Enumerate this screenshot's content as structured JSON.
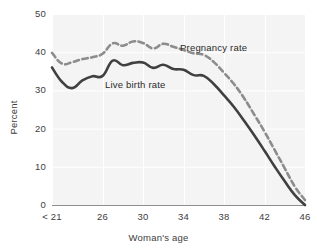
{
  "chart_data": {
    "type": "line",
    "title": "",
    "subtitle": "",
    "xlabel": "Woman's age",
    "ylabel": "Percent",
    "xlim": [
      21,
      46
    ],
    "ylim": [
      0,
      50
    ],
    "grid": true,
    "legend_position": "inline-annotation",
    "x_tick_labels": [
      "< 21",
      "26",
      "30",
      "34",
      "38",
      "42",
      "46"
    ],
    "x_tick_values": [
      21,
      26,
      30,
      34,
      38,
      42,
      46
    ],
    "y_tick_labels": [
      "0",
      "10",
      "20",
      "30",
      "40",
      "50"
    ],
    "y_tick_values": [
      0,
      10,
      20,
      30,
      40,
      50
    ],
    "x": [
      21,
      22,
      23,
      24,
      25,
      26,
      27,
      28,
      29,
      30,
      31,
      32,
      33,
      34,
      35,
      36,
      37,
      38,
      39,
      40,
      41,
      42,
      43,
      44,
      45,
      46
    ],
    "series": [
      {
        "name": "Pregnancy rate",
        "style": "dashed",
        "color": "#8c8c8c",
        "values": [
          39.8,
          37.0,
          37.4,
          38.2,
          38.7,
          39.6,
          42.3,
          41.7,
          42.8,
          42.4,
          41.0,
          42.2,
          41.4,
          40.6,
          39.7,
          39.3,
          37.4,
          34.6,
          31.6,
          27.9,
          23.6,
          19.2,
          14.4,
          9.6,
          4.8,
          1.3
        ],
        "annotation": {
          "text": "Pregnancy rate",
          "x_px": 180,
          "y_px": 42
        }
      },
      {
        "name": "Live birth rate",
        "style": "solid",
        "color": "#404040",
        "values": [
          36.0,
          32.2,
          30.6,
          32.6,
          33.7,
          33.8,
          37.8,
          36.6,
          37.2,
          37.3,
          35.9,
          36.7,
          35.6,
          35.4,
          34.0,
          33.8,
          31.6,
          28.7,
          25.6,
          22.0,
          18.2,
          14.2,
          10.1,
          6.2,
          2.6,
          0.0
        ],
        "annotation": {
          "text": "Live birth rate",
          "x_px": 105,
          "y_px": 79
        }
      }
    ],
    "colors": {
      "plot_background": "#f4f4f4",
      "gridline": "#ffffff",
      "axis_line": "#8f8f8f",
      "text": "#3d3d3d",
      "pregnancy_line": "#8c8c8c",
      "live_birth_line": "#404040"
    }
  },
  "axis": {
    "y_title": "Percent",
    "x_title": "Woman's age",
    "y_ticks": [
      {
        "label": "50",
        "value": 50
      },
      {
        "label": "40",
        "value": 40
      },
      {
        "label": "30",
        "value": 30
      },
      {
        "label": "20",
        "value": 20
      },
      {
        "label": "10",
        "value": 10
      },
      {
        "label": "0",
        "value": 0
      }
    ],
    "x_ticks": [
      {
        "label": "< 21",
        "value": 21
      },
      {
        "label": "26",
        "value": 26
      },
      {
        "label": "30",
        "value": 30
      },
      {
        "label": "34",
        "value": 34
      },
      {
        "label": "38",
        "value": 38
      },
      {
        "label": "42",
        "value": 42
      },
      {
        "label": "46",
        "value": 46
      }
    ]
  },
  "annotations": {
    "pregnancy_label": "Pregnancy rate",
    "live_birth_label": "Live birth rate"
  }
}
